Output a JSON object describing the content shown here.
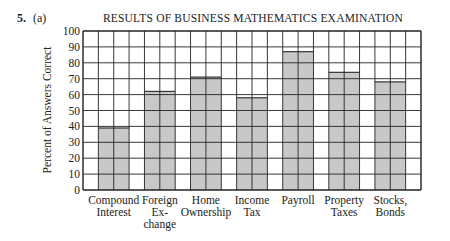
{
  "problem": {
    "number": "5.",
    "part": "(a)"
  },
  "chart_data": {
    "type": "bar",
    "title": "RESULTS OF BUSINESS MATHEMATICS EXAMINATION",
    "xlabel": "",
    "ylabel": "Percent of Answers Correct",
    "ylim": [
      0,
      100
    ],
    "yticks": [
      0,
      10,
      20,
      30,
      40,
      50,
      60,
      70,
      80,
      90,
      100
    ],
    "grid": true,
    "categories": [
      "Compound Interest",
      "Foreign Exchange",
      "Home Ownership",
      "Income Tax",
      "Payroll",
      "Property Taxes",
      "Stocks, Bonds"
    ],
    "category_labels": [
      [
        "Compound",
        "Interest"
      ],
      [
        "Foreign",
        "Ex-",
        "change"
      ],
      [
        "Home",
        "Ownership"
      ],
      [
        "Income",
        "Tax"
      ],
      [
        "Payroll"
      ],
      [
        "Property",
        "Taxes"
      ],
      [
        "Stocks,",
        "Bonds"
      ]
    ],
    "values": [
      39,
      62,
      71,
      58,
      87,
      74,
      68
    ],
    "bar_color": "#c8c8c8",
    "grid_color": "#222222"
  }
}
